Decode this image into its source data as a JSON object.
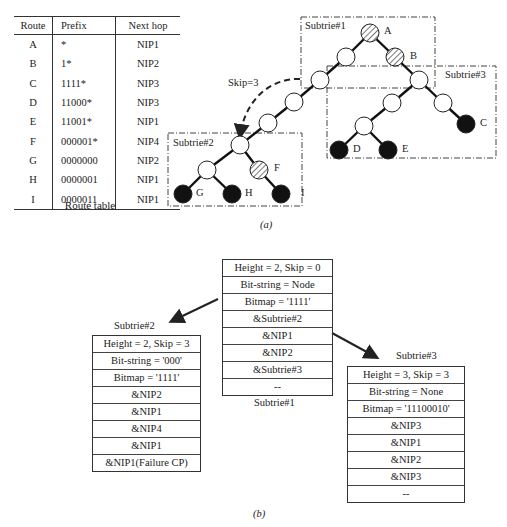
{
  "route_table": {
    "columns": [
      "Route",
      "Prefix",
      "Next hop"
    ],
    "rows": [
      {
        "route": "A",
        "prefix": "*",
        "next_hop": "NIP1"
      },
      {
        "route": "B",
        "prefix": "1*",
        "next_hop": "NIP2"
      },
      {
        "route": "C",
        "prefix": "1111*",
        "next_hop": "NIP3"
      },
      {
        "route": "D",
        "prefix": "11000*",
        "next_hop": "NIP3"
      },
      {
        "route": "E",
        "prefix": "11001*",
        "next_hop": "NIP1"
      },
      {
        "route": "F",
        "prefix": "000001*",
        "next_hop": "NIP4"
      },
      {
        "route": "G",
        "prefix": "0000000",
        "next_hop": "NIP2"
      },
      {
        "route": "H",
        "prefix": "0000001",
        "next_hop": "NIP1"
      },
      {
        "route": "I",
        "prefix": "0000011",
        "next_hop": "NIP1"
      }
    ],
    "caption": "Route table"
  },
  "trie": {
    "subtrie1_label": "Subtrie#1",
    "subtrie2_label": "Subtrie#2",
    "subtrie3_label": "Subtrie#3",
    "skip_label": "Skip=3",
    "node_labels": {
      "A": "A",
      "B": "B",
      "C": "C",
      "D": "D",
      "E": "E",
      "F": "F",
      "G": "G",
      "H": "H",
      "I": "I"
    },
    "caption": "(a)"
  },
  "structures": {
    "subtrie1": {
      "label": "Subtrie#1",
      "rows": [
        "Height = 2, Skip = 0",
        "Bit-string = Node",
        "Bitmap = '1111'",
        "&Subtrie#2",
        "&NIP1",
        "&NIP2",
        "&Subtrie#3",
        "--"
      ]
    },
    "subtrie2": {
      "label": "Subtrie#2",
      "rows": [
        "Height = 2, Skip = 3",
        "Bit-string = '000'",
        "Bitmap = '1111'",
        "&NIP2",
        "&NIP1",
        "&NIP4",
        "&NIP1",
        "&NIP1(Failure CP)"
      ]
    },
    "subtrie3": {
      "label": "Subtrie#3",
      "rows": [
        "Height = 3, Skip = 3",
        "Bit-string = None",
        "Bitmap = '11100010'",
        "&NIP3",
        "&NIP1",
        "&NIP2",
        "&NIP3",
        "--"
      ]
    },
    "caption": "(b)"
  }
}
